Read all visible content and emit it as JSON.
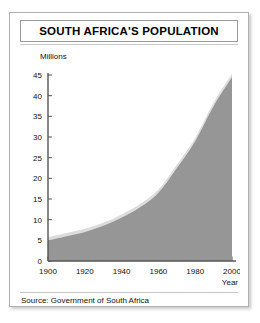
{
  "card": {
    "title": "SOUTH AFRICA'S POPULATION",
    "source": "Source: Government of South Africa"
  },
  "chart_data": {
    "type": "area",
    "title": "SOUTH AFRICA'S POPULATION",
    "xlabel": "Year",
    "ylabel": "Millions",
    "xlim": [
      1900,
      2000
    ],
    "ylim": [
      0,
      45
    ],
    "xticks": [
      1900,
      1920,
      1940,
      1960,
      1980,
      2000
    ],
    "xtick_labels": [
      "1900",
      "1920",
      "1940",
      "1960",
      "1980",
      "2000"
    ],
    "minor_xtick_step": 5,
    "yticks": [
      0,
      5,
      10,
      15,
      20,
      25,
      30,
      35,
      40,
      45
    ],
    "ytick_labels": [
      "0",
      "5",
      "10",
      "15",
      "20",
      "25",
      "30",
      "35",
      "40",
      "45"
    ],
    "grid": false,
    "legend": "none",
    "x": [
      1900,
      1910,
      1920,
      1930,
      1940,
      1950,
      1960,
      1970,
      1980,
      1990,
      2000
    ],
    "values": [
      5.0,
      6.0,
      7.0,
      8.5,
      10.5,
      13.0,
      16.5,
      22.5,
      29.0,
      37.5,
      44.5
    ],
    "series": [
      {
        "name": "Population (millions)",
        "values": [
          5.0,
          6.0,
          7.0,
          8.5,
          10.5,
          13.0,
          16.5,
          22.5,
          29.0,
          37.5,
          44.5
        ]
      }
    ],
    "annotations": [
      "Inflection near 1960 at about 16.5 million"
    ],
    "colors": {
      "fill": "#969696",
      "highlight": "#dcdcdc",
      "axis": "#555555",
      "text": "#111111",
      "card_border": "#b0b0b0"
    }
  }
}
